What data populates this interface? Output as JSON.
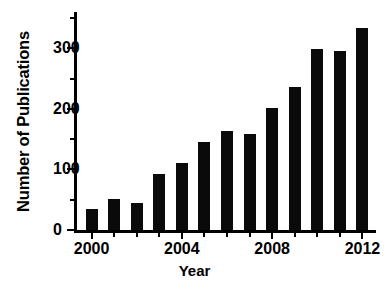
{
  "chart_data": {
    "type": "bar",
    "title": "",
    "xlabel": "Year",
    "ylabel": "Number of Publications",
    "categories": [
      "2000",
      "2001",
      "2002",
      "2003",
      "2004",
      "2005",
      "2006",
      "2007",
      "2008",
      "2009",
      "2010",
      "2011",
      "2012"
    ],
    "values": [
      34,
      52,
      44,
      93,
      111,
      146,
      164,
      159,
      202,
      236,
      299,
      296,
      333
    ],
    "series": [
      {
        "name": "Number of Publications",
        "values": [
          34,
          52,
          44,
          93,
          111,
          146,
          164,
          159,
          202,
          236,
          299,
          296,
          333
        ]
      }
    ],
    "ylim": [
      0,
      360
    ],
    "xlim": [
      1999.4,
      2012.6
    ],
    "y_ticks": [
      0,
      100,
      200,
      300
    ],
    "y_tick_labels": [
      "0",
      "100",
      "200",
      "300"
    ],
    "y_minor_ticks": [
      50,
      150,
      250,
      350
    ],
    "x_ticks": [
      2000,
      2004,
      2008,
      2012
    ],
    "x_tick_labels": [
      "2000",
      "2004",
      "2008",
      "2012"
    ],
    "x_minor_ticks": [
      2001,
      2002,
      2003,
      2005,
      2006,
      2007,
      2009,
      2010,
      2011
    ],
    "grid": false,
    "legend": null,
    "legend_position": "none",
    "bar_color": "#0a0a0a",
    "axis_color": "#000000",
    "background_color": "#ffffff"
  }
}
